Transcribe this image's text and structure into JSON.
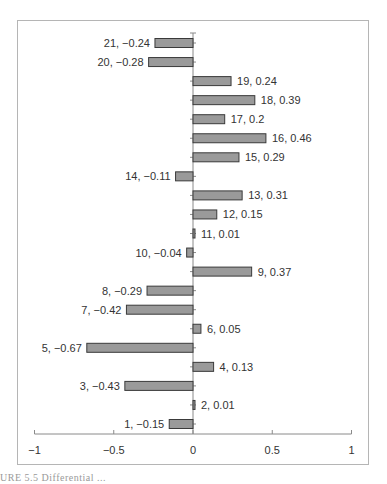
{
  "chart_data": {
    "type": "bar",
    "orientation": "horizontal",
    "title": "",
    "xlabel": "",
    "ylabel": "",
    "xlim": [
      -1,
      1
    ],
    "x_ticks": [
      -1,
      -0.5,
      0,
      0.5,
      1
    ],
    "x_tick_labels": [
      "−1",
      "−0.5",
      "0",
      "0.5",
      "1"
    ],
    "grid": false,
    "legend": null,
    "categories": [
      "1",
      "2",
      "3",
      "4",
      "5",
      "6",
      "7",
      "8",
      "9",
      "10",
      "11",
      "12",
      "13",
      "14",
      "15",
      "16",
      "17",
      "18",
      "19",
      "20",
      "21"
    ],
    "values": [
      -0.15,
      0.01,
      -0.43,
      0.13,
      -0.67,
      0.05,
      -0.42,
      -0.29,
      0.37,
      -0.04,
      0.01,
      0.15,
      0.31,
      -0.11,
      0.29,
      0.46,
      0.2,
      0.39,
      0.24,
      -0.28,
      -0.24
    ],
    "data_labels": [
      "1, −0.15",
      "2, 0.01",
      "3, −0.43",
      "4, 0.13",
      "5, −0.67",
      "6, 0.05",
      "7, −0.42",
      "8, −0.29",
      "9, 0.37",
      "10, −0.04",
      "11, 0.01",
      "12, 0.15",
      "13, 0.31",
      "14, −0.11",
      "15, 0.29",
      "16, 0.46",
      "17, 0.2",
      "18, 0.39",
      "19, 0.24",
      "20, −0.28",
      "21, −0.24"
    ],
    "bar_color": "#9a9a9a",
    "bar_outline": "#3a3a3a"
  },
  "caption": "URE 5.5   Differential ..."
}
